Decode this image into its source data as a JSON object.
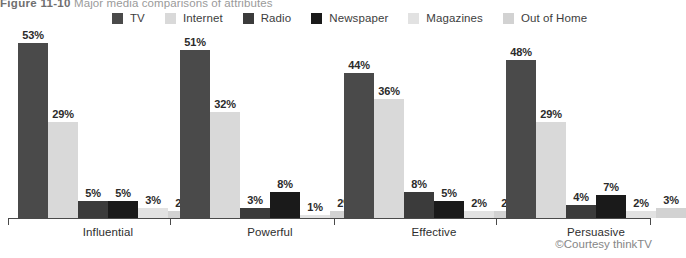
{
  "title": {
    "figure_number": "Figure 11-10",
    "caption": "Major media comparisons of attributes"
  },
  "credit": "©Courtesy thinkTV",
  "legend": {
    "position": "top",
    "items": [
      {
        "label": "TV",
        "color": "#4a4a4a"
      },
      {
        "label": "Internet",
        "color": "#d9d9d9"
      },
      {
        "label": "Radio",
        "color": "#3b3b3b"
      },
      {
        "label": "Newspaper",
        "color": "#1a1a1a"
      },
      {
        "label": "Magazines",
        "color": "#e2e2e2"
      },
      {
        "label": "Out of Home",
        "color": "#d2d2d2"
      }
    ]
  },
  "chart_data": {
    "type": "bar",
    "title": "Major media comparisons of attributes",
    "xlabel": "",
    "ylabel": "",
    "ylim": [
      0,
      60
    ],
    "grid": false,
    "legend_position": "top",
    "value_suffix": "%",
    "categories": [
      "Influential",
      "Powerful",
      "Effective",
      "Persuasive"
    ],
    "series": [
      {
        "name": "TV",
        "color": "#4a4a4a",
        "values": [
          53,
          51,
          44,
          48
        ],
        "labels": [
          "53%",
          "51%",
          "44%",
          "48%"
        ]
      },
      {
        "name": "Internet",
        "color": "#d9d9d9",
        "values": [
          29,
          32,
          36,
          29
        ],
        "labels": [
          "29%",
          "32%",
          "36%",
          "29%"
        ]
      },
      {
        "name": "Radio",
        "color": "#3b3b3b",
        "values": [
          5,
          3,
          8,
          4
        ],
        "labels": [
          "5%",
          "3%",
          "8%",
          "4%"
        ]
      },
      {
        "name": "Newspaper",
        "color": "#1a1a1a",
        "values": [
          5,
          8,
          5,
          7
        ],
        "labels": [
          "5%",
          "8%",
          "5%",
          "7%"
        ]
      },
      {
        "name": "Magazines",
        "color": "#e2e2e2",
        "values": [
          3,
          1,
          2,
          2
        ],
        "labels": [
          "3%",
          "1%",
          "2%",
          "2%"
        ]
      },
      {
        "name": "Out of Home",
        "color": "#d2d2d2",
        "values": [
          2,
          2,
          2,
          3
        ],
        "labels": [
          "2%",
          "2%",
          "2%",
          "3%"
        ]
      }
    ]
  }
}
